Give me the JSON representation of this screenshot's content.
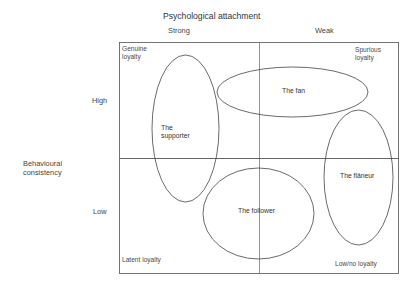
{
  "diagram": {
    "title": "Psychological attachment",
    "x_axis": {
      "label": "Psychological attachment",
      "left": "Strong",
      "right": "Weak"
    },
    "y_axis": {
      "label_line1": "Behavioural",
      "label_line2": "consistency",
      "top": "High",
      "bottom": "Low"
    },
    "quadrants": {
      "top_left_line1": "Genuine",
      "top_left_line2": "loyalty",
      "top_right_line1": "Spurious",
      "top_right_line2": "loyalty",
      "bottom_left": "Latent loyalty",
      "bottom_right": "Low/no loyalty"
    },
    "segments": [
      {
        "id": "supporter",
        "label_line1": "The",
        "label_line2": "supporter"
      },
      {
        "id": "fan",
        "label": "The fan"
      },
      {
        "id": "flaneur",
        "label": "The flâneur"
      },
      {
        "id": "follower",
        "label": "The follower"
      }
    ],
    "colors": {
      "line": "#555555",
      "ellipse": "#444444",
      "text": "#333333",
      "background": "#ffffff"
    }
  }
}
